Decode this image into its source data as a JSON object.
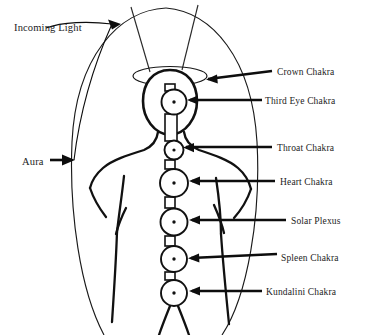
{
  "diagram": {
    "background_color": "#ffffff",
    "ink_color": "#111111",
    "figure": {
      "name": "human-body-outline",
      "description": "Front-facing human torso and head outline"
    },
    "aura": {
      "name": "aura-ellipse",
      "description": "Large oval field surrounding the body"
    },
    "crown_disc": {
      "name": "crown-ellipse",
      "description": "Flat ellipse above the head"
    }
  },
  "left_labels": [
    {
      "id": "incoming-light",
      "text": "Incoming Light",
      "x": 14,
      "y": 31
    },
    {
      "id": "aura",
      "text": "Aura",
      "x": 22,
      "y": 162
    }
  ],
  "right_labels": [
    {
      "id": "crown-chakra",
      "text": "Crown Chakra",
      "x": 277,
      "y": 75
    },
    {
      "id": "third-eye-chakra",
      "text": "Third Eye Chakra",
      "x": 265,
      "y": 102
    },
    {
      "id": "throat-chakra",
      "text": "Throat Chakra",
      "x": 277,
      "y": 149
    },
    {
      "id": "heart-chakra",
      "text": "Heart Chakra",
      "x": 280,
      "y": 183
    },
    {
      "id": "solar-plexus",
      "text": "Solar Plexus",
      "x": 291,
      "y": 222
    },
    {
      "id": "spleen-chakra",
      "text": "Spleen Chakra",
      "x": 281,
      "y": 259
    },
    {
      "id": "kundalini-chakra",
      "text": "Kundalini Chakra",
      "x": 266,
      "y": 293
    }
  ],
  "chakras": [
    {
      "id": "third-eye",
      "cx": 174,
      "cy": 102,
      "r": 12.5
    },
    {
      "id": "throat",
      "cx": 174,
      "cy": 150,
      "r": 9.5
    },
    {
      "id": "heart",
      "cx": 174,
      "cy": 183,
      "r": 14
    },
    {
      "id": "solar-plexus",
      "cx": 174,
      "cy": 222,
      "r": 13.5
    },
    {
      "id": "spleen",
      "cx": 174,
      "cy": 259,
      "r": 13
    },
    {
      "id": "kundalini",
      "cx": 174,
      "cy": 293,
      "r": 13
    }
  ]
}
